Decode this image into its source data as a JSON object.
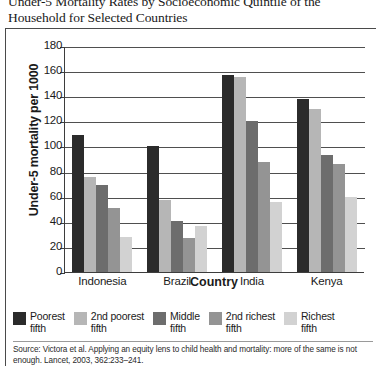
{
  "title": "Under-5 Mortality Rates by Socioeconomic Quintile of the Household for Selected Countries",
  "source": "Source: Victora et al. Applying an equity lens to child health and mortality: more of the same is not enough. Lancet, 2003, 362:233–241.",
  "chart_data": {
    "type": "bar",
    "title": "Under-5 Mortality Rates by Socioeconomic Quintile of the Household for Selected Countries",
    "xlabel": "Country",
    "ylabel": "Under-5 mortality per 1000",
    "categories": [
      "Indonesia",
      "Brazil",
      "India",
      "Kenya"
    ],
    "ylim": [
      0,
      180
    ],
    "yticks": [
      0,
      20,
      40,
      60,
      80,
      100,
      120,
      140,
      160,
      180
    ],
    "grid": true,
    "legend_position": "below",
    "series": [
      {
        "name": "Poorest fifth",
        "color": "#2b2b2b",
        "values": [
          109,
          100,
          157,
          138
        ]
      },
      {
        "name": "2nd poorest fifth",
        "color": "#b6b6b6",
        "values": [
          76,
          57,
          155,
          130
        ]
      },
      {
        "name": "Middle fifth",
        "color": "#6d6d6d",
        "values": [
          69,
          41,
          120,
          93
        ]
      },
      {
        "name": "2nd richest fifth",
        "color": "#949494",
        "values": [
          51,
          27,
          88,
          86
        ]
      },
      {
        "name": "Richest fifth",
        "color": "#d2d2d2",
        "values": [
          28,
          37,
          56,
          60
        ]
      }
    ]
  },
  "legend": [
    {
      "label": "Poorest\nfifth",
      "color": "#2b2b2b"
    },
    {
      "label": "2nd poorest\nfifth",
      "color": "#b6b6b6"
    },
    {
      "label": "Middle\nfifth",
      "color": "#6d6d6d"
    },
    {
      "label": "2nd richest\nfifth",
      "color": "#949494"
    },
    {
      "label": "Richest\nfifth",
      "color": "#d2d2d2"
    }
  ]
}
